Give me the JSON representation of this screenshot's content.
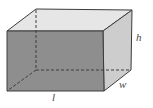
{
  "diagram": {
    "type": "rectangular-prism",
    "labels": {
      "height": "h",
      "width": "w",
      "length": "l"
    },
    "colors": {
      "front_face": "#8e8e8e",
      "top_face": "#e6e6e6",
      "right_face": "#cdcdcd",
      "edges": "#3c3c3c",
      "hidden_edges": "#3c3c3c",
      "background": "#ffffff"
    },
    "vertices": {
      "front_top_left": [
        7,
        31
      ],
      "front_top_right": [
        103,
        31
      ],
      "front_bottom_left": [
        7,
        91
      ],
      "front_bottom_right": [
        104,
        91
      ],
      "back_top_left": [
        36,
        9
      ],
      "back_top_right": [
        132,
        10
      ],
      "back_bottom_right": [
        131,
        70
      ],
      "back_bottom_left_hidden": [
        36,
        70
      ]
    }
  }
}
